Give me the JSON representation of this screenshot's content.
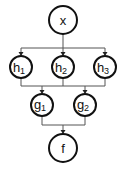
{
  "diagram": {
    "type": "computation-graph",
    "colors": {
      "node_stroke": "#111111",
      "edge": "#555555",
      "background": "#ffffff"
    },
    "nodes": {
      "x": {
        "label": "x",
        "sub": ""
      },
      "h1": {
        "label": "h",
        "sub": "1"
      },
      "h2": {
        "label": "h",
        "sub": "2"
      },
      "h3": {
        "label": "h",
        "sub": "3"
      },
      "g1": {
        "label": "g",
        "sub": "1"
      },
      "g2": {
        "label": "g",
        "sub": "2"
      },
      "f": {
        "label": "f",
        "sub": ""
      }
    },
    "edges": [
      {
        "from": "x",
        "to": [
          "h1",
          "h2",
          "h3"
        ]
      },
      {
        "from": [
          "h1",
          "h2",
          "h3"
        ],
        "to": [
          "g1",
          "g2"
        ]
      },
      {
        "from": [
          "g1",
          "g2"
        ],
        "to": "f"
      }
    ]
  }
}
